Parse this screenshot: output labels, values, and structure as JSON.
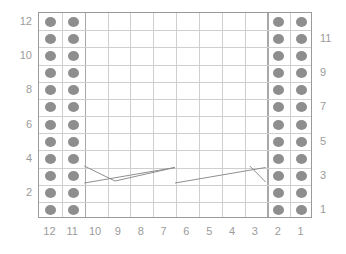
{
  "chart_data": {
    "type": "table",
    "title": "",
    "xlabel": "",
    "ylabel": "",
    "columns": 12,
    "rows": 12,
    "column_labels": [
      "12",
      "11",
      "10",
      "9",
      "8",
      "7",
      "6",
      "5",
      "4",
      "3",
      "2",
      "1"
    ],
    "row_labels_left": [
      "12",
      "",
      "10",
      "",
      "8",
      "",
      "6",
      "",
      "4",
      "",
      "2",
      ""
    ],
    "row_labels_right": [
      "",
      "11",
      "",
      "9",
      "",
      "7",
      "",
      "5",
      "",
      "3",
      "",
      "1"
    ],
    "left_axis_ticks": [
      "12",
      "10",
      "8",
      "6",
      "4",
      "2"
    ],
    "right_axis_ticks": [
      "11",
      "9",
      "7",
      "5",
      "3",
      "1"
    ],
    "symbols": {
      "purl": "purl-dot",
      "knit": "empty",
      "cable": "cable-cross-line"
    },
    "purl_columns": [
      12,
      11,
      2,
      1
    ],
    "purl_rows": [
      1,
      2,
      3,
      4,
      5,
      6,
      7,
      8,
      9,
      10,
      11,
      12
    ],
    "cable_rows": [
      3
    ],
    "cable_crossings": [
      {
        "row": 3,
        "start_column": 10,
        "end_column": 6,
        "direction": "left-over-right"
      },
      {
        "row": 3,
        "start_column": 6,
        "end_column": 3,
        "direction": "right-over-left"
      }
    ],
    "grid": true,
    "legend": []
  },
  "colors": {
    "grid_line": "#cfcfcf",
    "grid_border": "#9a9a9a",
    "separator": "#a8a8a8",
    "symbol": "#8e8e8e",
    "label_text": "#9b9b9b",
    "cable_line": "#8e8e8e",
    "background": "#ffffff"
  }
}
